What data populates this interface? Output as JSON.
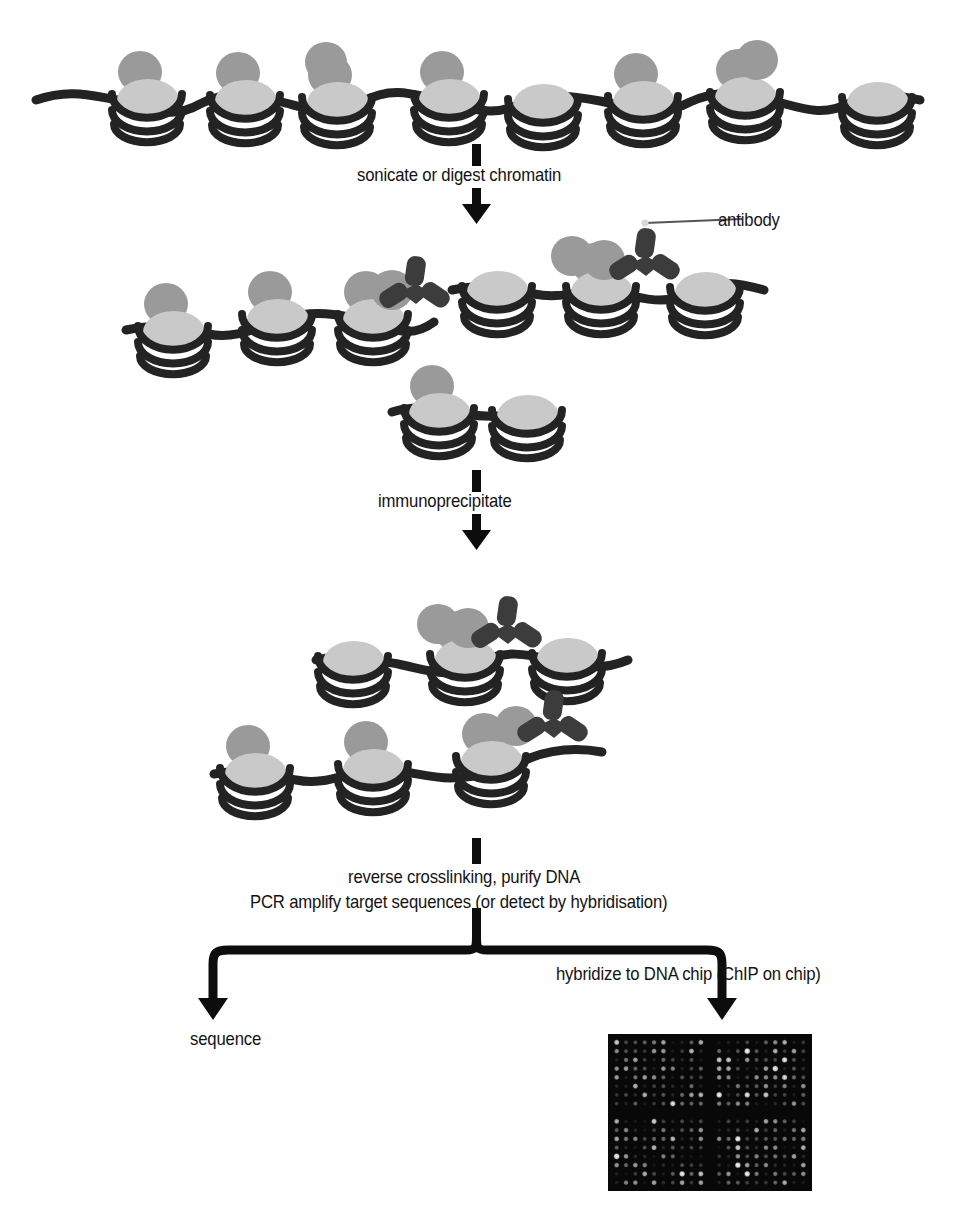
{
  "diagram": {
    "type": "process-flow"
  },
  "labels": {
    "step1": "sonicate or digest chromatin",
    "antibody": "antibody",
    "step2": "immunoprecipitate",
    "step3_line1": "reverse crosslinking, purify DNA",
    "step3_line2": "PCR amplify target sequences (or detect by hybridisation)",
    "branch_right": "hybridize to DNA chip (ChIP on chip)",
    "branch_left": "sequence"
  },
  "colors": {
    "background": "#ffffff",
    "nucleosome_front": "#c9c9c9",
    "nucleosome_back": "#9a9a9a",
    "dna_strand": "#232323",
    "antibody": "#3c3c3c",
    "arrow": "#0d0d0d",
    "text": "#131313",
    "chip_background": "#080808"
  },
  "stages": [
    {
      "name": "intact-chromatin",
      "order": 1,
      "description": "continuous chromatin fibre with beads-on-a-string nucleosomes",
      "nucleosome_count": 8,
      "antibody_count": 0
    },
    {
      "name": "fragmented-chromatin",
      "order": 2,
      "description": "three sheared chromatin fragments, two bearing antibodies",
      "fragments": 3,
      "nucleosome_count": 8,
      "antibody_count": 2
    },
    {
      "name": "immunoprecipitated-chromatin",
      "order": 3,
      "description": "two antibody-bound fragments recovered",
      "fragments": 2,
      "nucleosome_count": 6,
      "antibody_count": 2
    }
  ],
  "chip": {
    "name": "dna-microarray-image",
    "rows": 16,
    "cols": 20,
    "quadrant_gap": true,
    "spot_shape": "circle",
    "intensity_range": [
      0,
      255
    ]
  }
}
